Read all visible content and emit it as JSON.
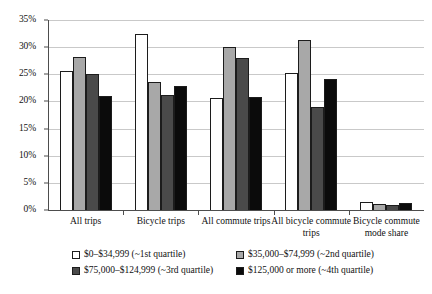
{
  "chart_data": {
    "type": "bar",
    "title": "",
    "subtitle": "",
    "xlabel": "",
    "ylabel": "",
    "ylim": [
      0,
      35
    ],
    "ytick_values": [
      0,
      5,
      10,
      15,
      20,
      25,
      30,
      35
    ],
    "ytick_labels": [
      "0%",
      "5%",
      "10%",
      "15%",
      "20%",
      "25%",
      "30%",
      "35%"
    ],
    "grid": true,
    "legend_position": "bottom",
    "categories": [
      "All trips",
      "Bicycle trips",
      "All commute trips",
      "All bicycle commute trips",
      "Bicycle commute mode share"
    ],
    "series": [
      {
        "name": "$0–$34,999 (~1st quartile)",
        "color": "#ffffff",
        "values": [
          25.7,
          32.5,
          20.6,
          25.2,
          1.4
        ]
      },
      {
        "name": "$35,000–$74,999 (~2nd quartile)",
        "color": "#a8a8a8",
        "values": [
          28.2,
          23.5,
          30.1,
          31.4,
          1.1
        ]
      },
      {
        "name": "$75,000–$124,999 (~3rd quartile)",
        "color": "#4a4a4a",
        "values": [
          25.0,
          21.2,
          28.0,
          19.0,
          0.9
        ]
      },
      {
        "name": "$125,000 or more (~4th quartile)",
        "color": "#0b0b0b",
        "values": [
          21.0,
          22.8,
          20.8,
          24.2,
          1.3
        ]
      }
    ]
  },
  "axis": {
    "y_labels": [
      "35%",
      "30%",
      "25%",
      "20%",
      "15%",
      "10%",
      "5%",
      "0%"
    ]
  },
  "categories_display": [
    "All trips",
    "Bicycle trips",
    "All commute trips",
    "All bicycle commute trips",
    "Bicycle commute mode share"
  ],
  "legend": {
    "items": [
      "$0–$34,999 (~1st quartile)",
      "$35,000–$74,999 (~2nd quartile)",
      "$75,000–$124,999 (~3rd quartile)",
      "$125,000 or more (~4th quartile)"
    ]
  },
  "colors": {
    "q1": "#ffffff",
    "q2": "#a8a8a8",
    "q3": "#4a4a4a",
    "q4": "#0b0b0b",
    "axis": "#4d4d4d",
    "grid": "#c9c9c9",
    "bar_outline": "#1c1c1c",
    "text": "#111111",
    "background": "#ffffff"
  }
}
